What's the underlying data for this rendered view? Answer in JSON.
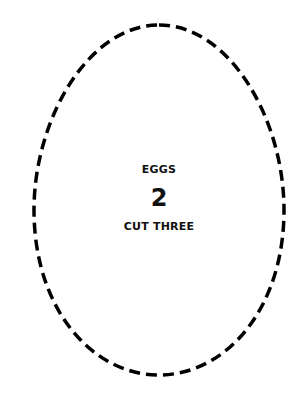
{
  "shape": {
    "type": "egg-outline",
    "stroke": "#000000",
    "style": "dashed"
  },
  "label": {
    "title": "EGGS",
    "count": "2",
    "instruction": "CUT THREE"
  }
}
